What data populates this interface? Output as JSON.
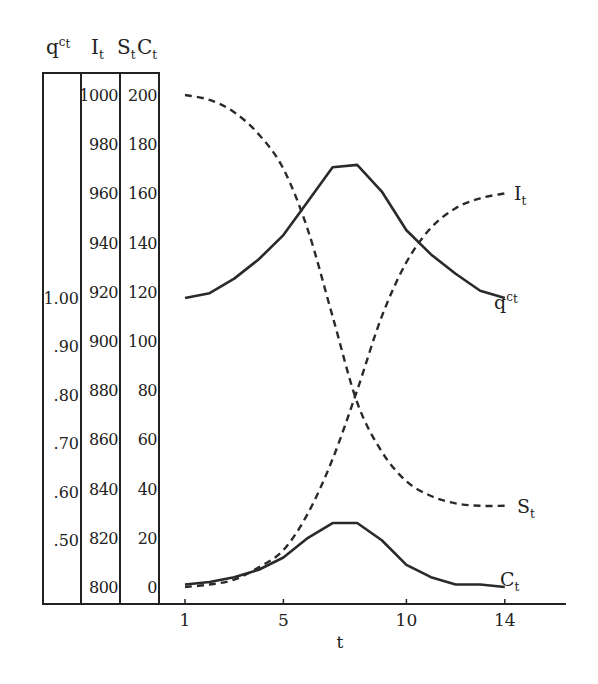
{
  "chart_data": {
    "type": "line",
    "title": "",
    "xlabel": "t",
    "x_ticks": [
      1,
      5,
      10,
      14
    ],
    "xlim": [
      1,
      15.5
    ],
    "axes": [
      {
        "name": "q^c_t",
        "header": "q",
        "header_sup": "c",
        "header_sub": "t",
        "ticks": [
          "1.00",
          ".90",
          ".80",
          ".70",
          ".60",
          ".50"
        ],
        "range": [
          0.45,
          1.05
        ]
      },
      {
        "name": "I_t",
        "header": "I",
        "header_sub": "t",
        "ticks": [
          "1000",
          "980",
          "960",
          "940",
          "920",
          "900",
          "880",
          "860",
          "840",
          "820",
          "800"
        ],
        "range": [
          800,
          1000
        ]
      },
      {
        "name": "S_t",
        "header": "S",
        "header_sub": "t",
        "ticks": [
          "200",
          "180",
          "160",
          "140",
          "120",
          "100",
          "80",
          "60",
          "40",
          "20",
          "0"
        ],
        "range": [
          0,
          200
        ]
      },
      {
        "name": "C_t",
        "header": "C",
        "header_sub": "t",
        "note": "shares scale with S_t"
      }
    ],
    "series": [
      {
        "name": "S_t",
        "style": "dashed",
        "axis": "S_t",
        "label": "S",
        "label_sub": "t",
        "x": [
          1,
          2,
          3,
          4,
          5,
          6,
          7,
          8,
          9,
          10,
          11,
          12,
          13,
          14
        ],
        "values": [
          200,
          198,
          193,
          184,
          170,
          145,
          110,
          75,
          55,
          43,
          37,
          34,
          33,
          33
        ]
      },
      {
        "name": "I_t",
        "style": "dashed",
        "axis": "I_t",
        "label": "I",
        "label_sub": "t",
        "x": [
          1,
          2,
          3,
          4,
          5,
          6,
          7,
          8,
          9,
          10,
          11,
          12,
          13,
          14
        ],
        "values": [
          800,
          801,
          803,
          808,
          815,
          830,
          852,
          880,
          910,
          932,
          946,
          954,
          958,
          960
        ]
      },
      {
        "name": "q^c_t",
        "style": "solid",
        "axis": "q^c_t",
        "label": "q",
        "label_sup": "c",
        "label_sub": "t",
        "x": [
          1,
          2,
          3,
          4,
          5,
          6,
          7,
          8,
          9,
          10,
          11,
          12,
          13,
          14
        ],
        "values": [
          1.0,
          0.99,
          0.96,
          0.92,
          0.87,
          0.8,
          0.73,
          0.725,
          0.78,
          0.86,
          0.91,
          0.95,
          0.985,
          1.0
        ]
      },
      {
        "name": "C_t",
        "style": "solid",
        "axis": "S_t",
        "label": "C",
        "label_sub": "t",
        "x": [
          1,
          2,
          3,
          4,
          5,
          6,
          7,
          8,
          9,
          10,
          11,
          12,
          13,
          14
        ],
        "values": [
          1,
          2,
          4,
          7,
          12,
          20,
          26,
          26,
          19,
          9,
          4,
          1,
          1,
          0
        ]
      }
    ],
    "grid": false,
    "legend": "inline labels at line ends"
  },
  "labels": {
    "xlabel": "t",
    "header_q": "q",
    "header_q_sup": "c",
    "header_q_sub": "t",
    "header_I": "I",
    "header_I_sub": "t",
    "header_S": "S",
    "header_S_sub": "t",
    "header_C": "C",
    "header_C_sub": "t",
    "series_S": "S",
    "series_I": "I",
    "series_q": "q",
    "series_q_sup": "c",
    "series_C": "C",
    "sub_t": "t"
  }
}
